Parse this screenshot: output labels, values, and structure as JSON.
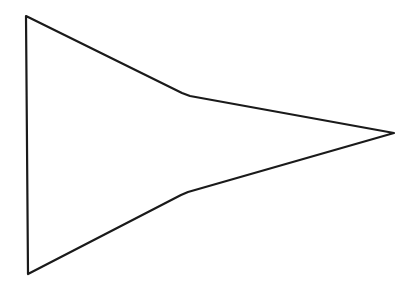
{
  "diagram": {
    "type": "outline-shape",
    "stroke_color": "#1a1a1a",
    "background": "#ffffff",
    "points": "26,16 182,93 190,96 394,133 188,192 181,195 28,274"
  }
}
